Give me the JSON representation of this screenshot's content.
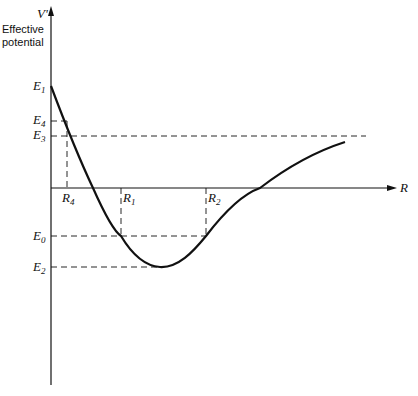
{
  "diagram": {
    "y_axis_label": "V'",
    "y_axis_title_line1": "Effective",
    "y_axis_title_line2": "potential",
    "x_axis_label": "R",
    "energy_levels": [
      {
        "name": "E",
        "sub": "1"
      },
      {
        "name": "E",
        "sub": "4"
      },
      {
        "name": "E",
        "sub": "3"
      },
      {
        "name": "E",
        "sub": "0"
      },
      {
        "name": "E",
        "sub": "2"
      }
    ],
    "radii": [
      {
        "name": "R",
        "sub": "4"
      },
      {
        "name": "R",
        "sub": "1"
      },
      {
        "name": "R",
        "sub": "2"
      }
    ],
    "colors": {
      "line": "#111111",
      "background": "#ffffff"
    }
  }
}
